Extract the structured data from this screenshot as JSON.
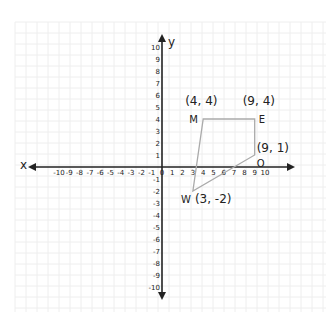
{
  "diagram": {
    "type": "coordinate-plane",
    "x_axis_label": "x",
    "y_axis_label": "y",
    "x_range": [
      -10,
      10
    ],
    "y_range": [
      -10,
      10
    ],
    "x_ticks": [
      "-10",
      "-9",
      "-8",
      "-7",
      "-6",
      "-5",
      "-4",
      "-3",
      "-2",
      "-1",
      "0",
      "1",
      "2",
      "3",
      "4",
      "5",
      "6",
      "7",
      "8",
      "9",
      "10"
    ],
    "y_ticks": [
      "10",
      "9",
      "8",
      "7",
      "6",
      "5",
      "4",
      "3",
      "2",
      "1",
      "-1",
      "-2",
      "-3",
      "-4",
      "-5",
      "-6",
      "-7",
      "-8",
      "-9",
      "-10"
    ],
    "shape": {
      "name": "MEOW",
      "stroke_color": "#aaaaaa",
      "vertices": [
        {
          "name": "M",
          "coord_label": "(4, 4)",
          "x": 4,
          "y": 4
        },
        {
          "name": "E",
          "coord_label": "(9, 4)",
          "x": 9,
          "y": 4
        },
        {
          "name": "O",
          "coord_label": "(9, 1)",
          "x": 9,
          "y": 1
        },
        {
          "name": "W",
          "coord_label": "(3, -2)",
          "x": 3,
          "y": -2
        }
      ]
    },
    "grid_color": "#eeeeee",
    "axis_color": "#222222"
  }
}
